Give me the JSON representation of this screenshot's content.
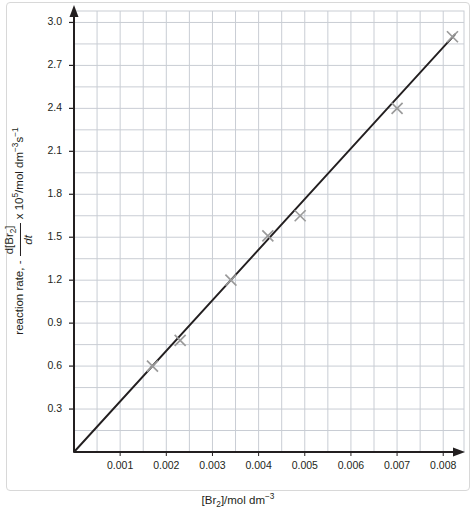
{
  "chart_data": {
    "type": "scatter",
    "title": "",
    "xlabel_parts": {
      "prefix": "[Br",
      "sub": "2",
      "suffix": "]/mol dm",
      "sup": "−3"
    },
    "xlabel": "[Br2]/mol dm^-3",
    "ylabel_parts": {
      "lead": "reaction rate, - ",
      "numerator_prefix": "d[Br",
      "numerator_sub": "2",
      "numerator_suffix": "]",
      "denominator": "dt",
      "tail_prefix": " x 10",
      "tail_sup": "5",
      "tail_mid": "/mol dm",
      "tail_sup2": "−3",
      "tail_s": "s",
      "tail_sup3": "−1"
    },
    "ylabel": "reaction rate, - d[Br2]/dt x 10^5/mol dm^-3 s^-1",
    "xticks": [
      0.001,
      0.002,
      0.003,
      0.004,
      0.005,
      0.006,
      0.007,
      0.008
    ],
    "xtick_labels": [
      "0.001",
      "0.002",
      "0.003",
      "0.004",
      "0.005",
      "0.006",
      "0.007",
      "0.008"
    ],
    "yticks": [
      0.3,
      0.6,
      0.9,
      1.2,
      1.5,
      1.8,
      2.1,
      2.4,
      2.7,
      3.0
    ],
    "ytick_labels": [
      "0.3",
      "0.6",
      "0.9",
      "1.2",
      "1.5",
      "1.8",
      "2.1",
      "2.4",
      "2.7",
      "3.0"
    ],
    "xlim": [
      0.0,
      0.00845
    ],
    "ylim": [
      0.0,
      3.08
    ],
    "grid": true,
    "grid_color": "#c9cdd4",
    "legend": null,
    "marker_style": "x",
    "marker_color": "#9a9a9a",
    "line_color": "#231f20",
    "axis_color": "#231f20",
    "points": [
      {
        "x": 0.0017,
        "y": 0.6
      },
      {
        "x": 0.0023,
        "y": 0.78
      },
      {
        "x": 0.0034,
        "y": 1.2
      },
      {
        "x": 0.0042,
        "y": 1.51
      },
      {
        "x": 0.0049,
        "y": 1.65
      },
      {
        "x": 0.007,
        "y": 2.4
      },
      {
        "x": 0.0082,
        "y": 2.9
      }
    ],
    "fit_line": {
      "type": "line",
      "x_start": 0.0,
      "y_start": 0.0,
      "x_end": 0.00825,
      "y_end": 2.915,
      "slope": 353.3,
      "intercept": 0.0
    }
  }
}
